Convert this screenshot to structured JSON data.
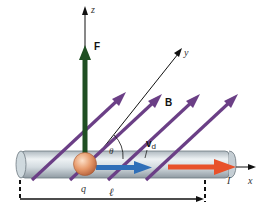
{
  "diagram": {
    "type": "physics-force-on-moving-charge-in-wire",
    "labels": {
      "z_axis": "z",
      "y_axis": "y",
      "x_axis": "x",
      "force": "F",
      "field": "B",
      "angle": "θ",
      "drift_velocity_main": "v",
      "drift_velocity_sub": "d",
      "charge": "q",
      "length": "ℓ",
      "current": "I"
    },
    "colors": {
      "force_arrow": "#1f4f22",
      "field_arrows": "#6b3f86",
      "velocity_arrow": "#2f6fb8",
      "current_arrow": "#e8512a",
      "charge_sphere": "#e79a6b",
      "wire": "#c9d3d9",
      "axes": "#111111"
    }
  }
}
